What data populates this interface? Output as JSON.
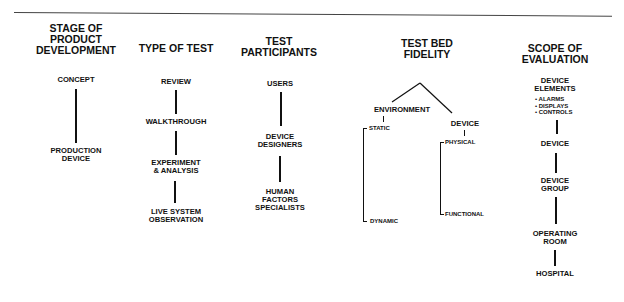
{
  "columns": [
    {
      "header": [
        "STAGE OF",
        "PRODUCT",
        "DEVELOPMENT"
      ],
      "items": [
        {
          "label": [
            "CONCEPT"
          ]
        },
        {
          "label": [
            "PRODUCTION",
            "DEVICE"
          ]
        }
      ]
    },
    {
      "header": [
        "TYPE OF TEST"
      ],
      "items": [
        {
          "label": [
            "REVIEW"
          ]
        },
        {
          "label": [
            "WALKTHROUGH"
          ]
        },
        {
          "label": [
            "EXPERIMENT",
            "& ANALYSIS"
          ]
        },
        {
          "label": [
            "LIVE SYSTEM",
            "OBSERVATION"
          ]
        }
      ]
    },
    {
      "header": [
        "TEST",
        "PARTICIPANTS"
      ],
      "items": [
        {
          "label": [
            "USERS"
          ]
        },
        {
          "label": [
            "DEVICE",
            "DESIGNERS"
          ]
        },
        {
          "label": [
            "HUMAN",
            "FACTORS",
            "SPECIALISTS"
          ]
        }
      ]
    },
    {
      "header": [
        "TEST BED",
        "FIDELITY"
      ],
      "branches": [
        {
          "label": "ENVIRONMENT",
          "range": [
            "STATIC",
            "DYNAMIC"
          ]
        },
        {
          "label": "DEVICE",
          "range": [
            "PHYSICAL",
            "FUNCTIONAL"
          ]
        }
      ]
    },
    {
      "header": [
        "SCOPE OF",
        "EVALUATION"
      ],
      "items": [
        {
          "label": [
            "DEVICE",
            "ELEMENTS"
          ],
          "bullets": [
            "ALARMS",
            "DISPLAYS",
            "CONTROLS"
          ]
        },
        {
          "label": [
            "DEVICE"
          ]
        },
        {
          "label": [
            "DEVICE",
            "GROUP"
          ]
        },
        {
          "label": [
            "OPERATING",
            "ROOM"
          ]
        },
        {
          "label": [
            "HOSPITAL"
          ]
        }
      ]
    }
  ],
  "bullet_glyph": "•"
}
